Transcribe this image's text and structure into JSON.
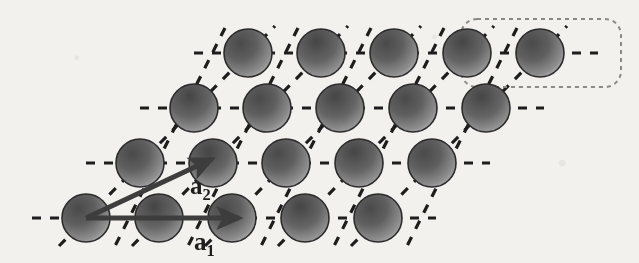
{
  "figure": {
    "background_color": "#f2f1ee",
    "atom": {
      "radius": 24,
      "outline_color": "#2b2b2b",
      "outline_width": 1.6,
      "gradient_dark": "#4a4a4a",
      "gradient_mid": "#6e6e6e",
      "gradient_light": "#cfcfcf"
    },
    "lattice_lines": {
      "color": "#1d1d1d",
      "width": 3.2,
      "dash_pattern": "9 9",
      "families": [
        "horizontal",
        "diagonal-up-right",
        "diagonal-down-right"
      ]
    },
    "basis_box": {
      "label": "unit-cell-basis",
      "color": "#8a8a84",
      "dash_pattern": "4 4",
      "stroke_width": 2,
      "corner_radius": 16,
      "x": 461,
      "y": 18,
      "width": 160,
      "height": 68,
      "atoms_enclosed": 2
    },
    "vectors": [
      {
        "name": "a1",
        "label": "a",
        "subscript": "1",
        "label_x": 194,
        "label_y": 248,
        "from_x": 86,
        "from_y": 218,
        "to_x": 243,
        "to_y": 218,
        "color": "#3d3d3d",
        "width": 5,
        "direction": "horizontal-right",
        "length_px": 157
      },
      {
        "name": "a2",
        "label": "a",
        "subscript": "2",
        "label_x": 190,
        "label_y": 192,
        "from_x": 86,
        "from_y": 218,
        "to_x": 216,
        "to_y": 157,
        "color": "#3d3d3d",
        "width": 5,
        "direction": "diagonal-up-right",
        "length_px": 143
      }
    ],
    "lattice": {
      "origin_x": 86,
      "origin_y": 218,
      "a1_dx": 73,
      "a1_dy": 0,
      "a2_dx": 54,
      "a2_dy": -55,
      "rows": 4,
      "cols": 5,
      "atom_centers": [
        [
          86,
          218
        ],
        [
          159,
          218
        ],
        [
          232,
          218
        ],
        [
          305,
          218
        ],
        [
          378,
          218
        ],
        [
          140,
          163
        ],
        [
          213,
          163
        ],
        [
          286,
          163
        ],
        [
          359,
          163
        ],
        [
          432,
          163
        ],
        [
          194,
          108
        ],
        [
          267,
          108
        ],
        [
          340,
          108
        ],
        [
          413,
          108
        ],
        [
          486,
          108
        ],
        [
          248,
          53
        ],
        [
          321,
          53
        ],
        [
          394,
          53
        ],
        [
          467,
          53
        ],
        [
          540,
          53
        ]
      ]
    }
  }
}
